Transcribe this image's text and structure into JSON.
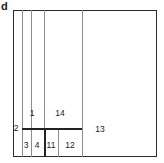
{
  "figure": {
    "panel_letter": "d",
    "type": "rectangular-partition",
    "frame": {
      "x": 13,
      "y": 10,
      "width": 144,
      "height": 147
    },
    "colors": {
      "background": "#ffffff",
      "frame_stroke": "#2b2b2b",
      "thin_rule": "#8c8c8c",
      "thick_rule": "#232323",
      "text": "#1a1a1a"
    }
  },
  "dividers": {
    "vertical": [
      {
        "name": "v-22",
        "x": 22,
        "y_top": 10,
        "y_bottom": 157,
        "weight": "thin"
      },
      {
        "name": "v-31",
        "x": 31,
        "y_top": 10,
        "y_bottom": 157,
        "weight": "thin"
      },
      {
        "name": "v-44-upper",
        "x": 44,
        "y_top": 10,
        "y_bottom": 128,
        "weight": "thin"
      },
      {
        "name": "v-44-lower",
        "x": 44,
        "y_top": 128,
        "y_bottom": 157,
        "weight": "thick"
      },
      {
        "name": "v-58",
        "x": 58,
        "y_top": 128,
        "y_bottom": 157,
        "weight": "thin"
      },
      {
        "name": "v-82",
        "x": 82,
        "y_top": 10,
        "y_bottom": 157,
        "weight": "thin"
      }
    ],
    "horizontal": [
      {
        "name": "h-128",
        "y": 128,
        "x_left": 22,
        "x_right": 82,
        "weight": "thick"
      }
    ]
  },
  "regions": [
    {
      "id": "1",
      "label": "1",
      "cx": 32,
      "cy": 113,
      "anchor": "center"
    },
    {
      "id": "14",
      "label": "14",
      "cx": 60,
      "cy": 113,
      "anchor": "center"
    },
    {
      "id": "2",
      "label": "2",
      "cx": 16,
      "cy": 128,
      "anchor": "center"
    },
    {
      "id": "13",
      "label": "13",
      "cx": 100,
      "cy": 129,
      "anchor": "center"
    },
    {
      "id": "3",
      "label": "3",
      "cx": 26,
      "cy": 145,
      "anchor": "center"
    },
    {
      "id": "4",
      "label": "4",
      "cx": 37,
      "cy": 145,
      "anchor": "center"
    },
    {
      "id": "11",
      "label": "11",
      "cx": 51,
      "cy": 145,
      "anchor": "center"
    },
    {
      "id": "12",
      "label": "12",
      "cx": 70,
      "cy": 145,
      "anchor": "center"
    }
  ]
}
